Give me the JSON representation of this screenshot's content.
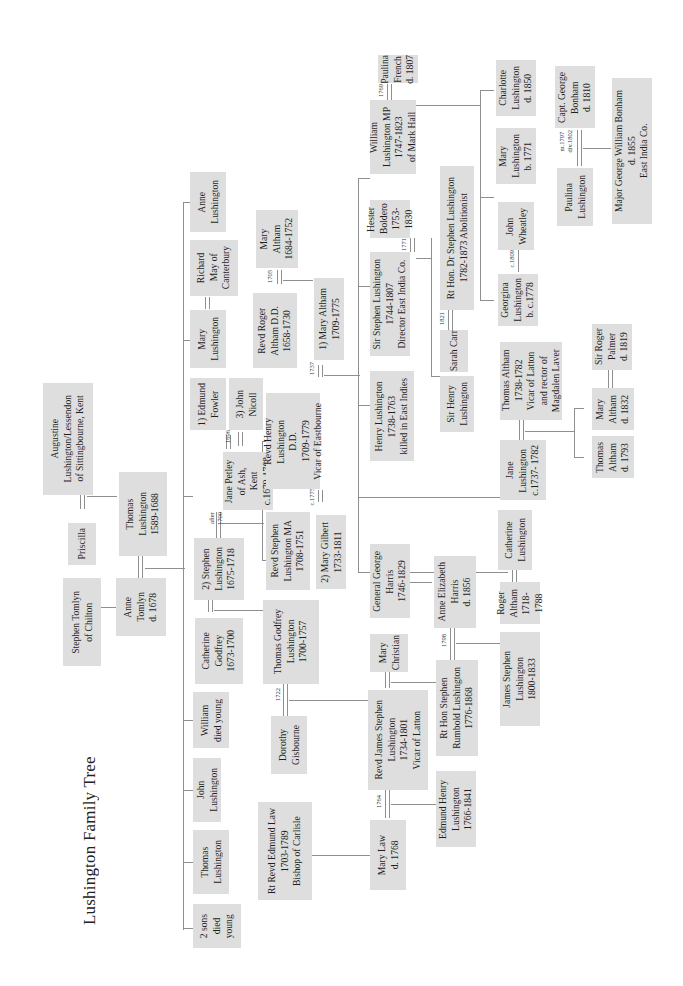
{
  "document": {
    "title": "Lushington Family Tree",
    "orientation": "rotated 90deg counter-clockwise (landscape tree printed on portrait page)"
  },
  "people": {
    "augustine": "Augustine\nLushington/Lessendon\nof Sittingbourne, Kent",
    "priscilla": "Priscilla",
    "thomas_1589": "Thomas\nLushington\n1589-1688",
    "stephen_tomlyn": "Stephen Tomlyn\nof Chilton",
    "anne_tomlyn": "Anne\nTomlyn\nd. 1678",
    "two_sons": "2 sons\ndied\nyoung",
    "thomas_l": "Thomas\nLushington",
    "john_l": "John\nLushington",
    "william_young": "William\ndied young",
    "catherine_godfrey": "Catherine\nGodfrey\n1673-1700",
    "stephen_1675": "2) Stephen\nLushington\n1675-1718",
    "jane_petley": "Jane Petley\nof Ash,\nKent\nc.1679-1763",
    "edmund_fowler": "1) Edmund\nFowler",
    "john_nicoll": "3) John\nNicoll",
    "mary_lushington": "Mary\nLushington",
    "richard_may": "Richard\nMay of\nCanterbury",
    "anne_lushington": "Anne\nLushington",
    "thomas_godfrey": "Thomas Godfrey\nLushington\n1700-1757",
    "stephen_ma": "Revd Stephen\nLushington MA\n1708-1751",
    "henry_dd": "Revd Henry\nLushington\nD.D.\n1709-1779\nVicar of Eastbourne",
    "roger_altham": "Revd Roger\nAltham D.D.\n1658-1730",
    "mary_altham_1684": "Mary\nAltham\n1684-1752",
    "mary_altham_1709": "1) Mary Altham\n1709-1775",
    "mary_gilbert": "2) Mary Gilbert\n1733-1811",
    "dorothy": "Dorothy\nGisbourne",
    "james_stephen": "Revd James Stephen\nLushington\n1734-1801\nVicar of Latton",
    "mary_christian": "Mary\nChristian",
    "general_harris": "General George\nHarris\n1746-1829",
    "edmund_law": "Rt Revd Edmund Law\n1703-1789\nBishop of Carlisle",
    "mary_law": "Mary Law\nd. 1768",
    "edmund_henry": "Edmund Henry\nLushington\n1766-1841",
    "rumbold": "Rt Hon Stephen\nRumbold Lushington\n1776-1868",
    "anne_harris": "Anne Elizabeth\nHarris\nd. 1856",
    "james_1800": "James Stephen\nLushington\n1800-1833",
    "henry_1738": "Henry Lushington\n1738-1763\nkilled in East Indies",
    "sir_stephen": "Sir Stephen Lushington\n1744-1807\nDirector East India Co.",
    "hester": "Hester\nBoldero\n1753-1830",
    "william_mp": "William\nLushington MP\n1747-1823\nof Mark Hall",
    "paulina_french": "Paulina\nFrench\nd. 1807",
    "catherine_l": "Catherine\nLushington",
    "roger_altham_1718": "Roger\nAltham\n1718-\n1788",
    "jane_l": "Jane\nLushington\nc.1737- 1782",
    "thomas_altham": "Thomas Altham\n1738-1782\nVicar of Latton\nand rector of\nMagdalen Laver",
    "sir_henry": "Sir Henry\nLushington",
    "sarah_carr": "Sarah Carr",
    "dr_stephen": "Rt Hon. Dr Stephen Lushington\n1782-1873 Abolitionist",
    "georgina": "Georgina\nLushington\nb. c.1778",
    "john_wheatley": "John\nWheatley",
    "mary_1771": "Mary\nLushington\nb. 1771",
    "charlotte": "Charlotte\nLushington\nd. 1850",
    "paulina_l": "Paulina\nLushington",
    "capt_bonham": "Capt. George\nBonham\nd. 1810",
    "major_bonham": "Major George William Bonham\nd. 1855\nEast India Co.",
    "thomas_altham_1793": "Thomas\nAltham\nd. 1793",
    "mary_altham_1832": "Mary\nAltham\nd. 1832",
    "roger_palmer": "Sir Roger\nPalmer\nd. 1819"
  },
  "marriage_years": {
    "stephen_jane": "after\n1700",
    "jane_edmund": "1696",
    "roger_mary": "1705",
    "henry_mary": "1737",
    "henry_gilbert": "c.1775",
    "thomas_dorothy": "1722",
    "james_marylaw": "1764",
    "rumbold_anne": "1798",
    "stephen_hester": "1771",
    "william_paulina": "1769",
    "drstephen_sarah": "1821",
    "georgina_wheatley": "c.1809",
    "paulina_bonham": "m.1797\ndiv.1802"
  },
  "colors": {
    "box": "#dedede",
    "line": "#8f8f8f",
    "background": "#ffffff"
  }
}
